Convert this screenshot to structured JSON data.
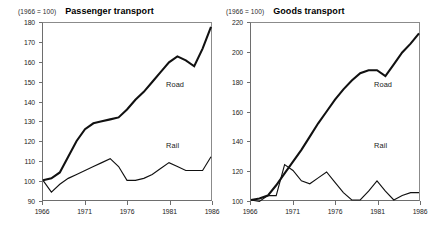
{
  "figure": {
    "panels": [
      {
        "id": "passenger",
        "base_note": "(1966 = 100)",
        "title": "Passenger transport"
      },
      {
        "id": "goods",
        "base_note": "(1966 = 100)",
        "title": "Goods transport"
      }
    ]
  },
  "chart_data": [
    {
      "type": "line",
      "title": "Passenger transport",
      "subtitle": "(1966 = 100)",
      "xlabel": "",
      "ylabel": "",
      "xlim": [
        1966,
        1986
      ],
      "ylim": [
        90,
        180
      ],
      "yticks": [
        90,
        100,
        110,
        120,
        130,
        140,
        150,
        160,
        170,
        180
      ],
      "xticks": [
        1966,
        1971,
        1976,
        1981,
        1986
      ],
      "grid": false,
      "legend_position": "inline-annotation",
      "x": [
        1966,
        1967,
        1968,
        1969,
        1970,
        1971,
        1972,
        1973,
        1974,
        1975,
        1976,
        1977,
        1978,
        1979,
        1980,
        1981,
        1982,
        1983,
        1984,
        1985,
        1986
      ],
      "series": [
        {
          "name": "Road",
          "values": [
            100,
            101,
            104,
            112,
            120,
            126,
            129,
            130,
            131,
            132,
            136,
            141,
            145,
            150,
            155,
            160,
            163,
            161,
            158,
            167,
            178
          ]
        },
        {
          "name": "Rail",
          "values": [
            100,
            94,
            98,
            101,
            103,
            105,
            107,
            109,
            111,
            107,
            100,
            100,
            101,
            103,
            106,
            109,
            107,
            105,
            105,
            105,
            112
          ]
        }
      ]
    },
    {
      "type": "line",
      "title": "Goods transport",
      "subtitle": "(1966 = 100)",
      "xlabel": "",
      "ylabel": "",
      "xlim": [
        1966,
        1986
      ],
      "ylim": [
        100,
        220
      ],
      "yticks": [
        100,
        120,
        140,
        160,
        180,
        200,
        220
      ],
      "xticks": [
        1966,
        1971,
        1976,
        1981,
        1986
      ],
      "grid": false,
      "legend_position": "inline-annotation",
      "x": [
        1966,
        1967,
        1968,
        1969,
        1970,
        1971,
        1972,
        1973,
        1974,
        1975,
        1976,
        1977,
        1978,
        1979,
        1980,
        1981,
        1982,
        1983,
        1984,
        1985,
        1986
      ],
      "series": [
        {
          "name": "Road",
          "values": [
            100,
            101,
            103,
            110,
            118,
            126,
            134,
            143,
            152,
            160,
            168,
            175,
            181,
            186,
            188,
            188,
            184,
            192,
            200,
            206,
            213
          ]
        },
        {
          "name": "Rail",
          "values": [
            100,
            99,
            103,
            103,
            124,
            120,
            113,
            111,
            115,
            119,
            112,
            105,
            100,
            100,
            106,
            113,
            106,
            100,
            103,
            105,
            105
          ]
        }
      ]
    }
  ]
}
